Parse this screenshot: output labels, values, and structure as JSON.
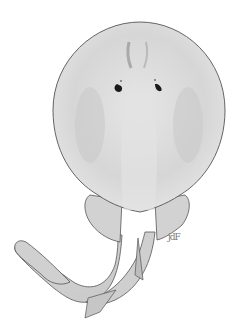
{
  "illustration": {
    "subject": "electric ray, dorsal view",
    "signature": "jdF",
    "colors": {
      "background": "#ffffff",
      "body": "#dcdcdc",
      "shading": "#c4c4c4",
      "outline": "#555555",
      "eyes": "#1a1a1a"
    }
  }
}
